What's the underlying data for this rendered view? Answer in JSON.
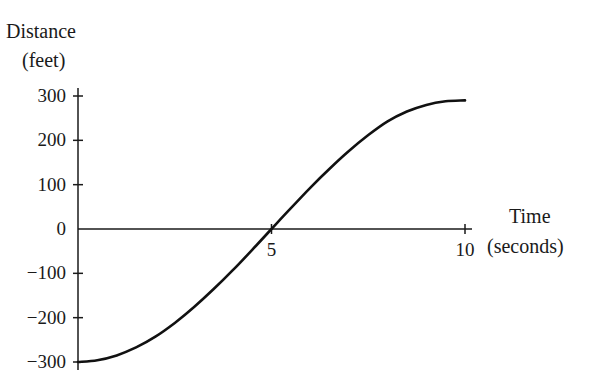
{
  "chart_data": {
    "type": "line",
    "title": "",
    "ylabel_line1": "Distance",
    "ylabel_line2": "(feet)",
    "xlabel_line1": "Time",
    "xlabel_line2": "(seconds)",
    "xlim": [
      0,
      10
    ],
    "ylim": [
      -300,
      300
    ],
    "grid": false,
    "legend": "none",
    "x_ticks": [
      5,
      10
    ],
    "x_tick_labels": [
      "5",
      "10"
    ],
    "y_ticks": [
      300,
      200,
      100,
      0,
      -100,
      -200,
      -300
    ],
    "y_tick_labels": [
      "300",
      "200",
      "100",
      "0",
      "-100",
      "-200",
      "-300"
    ],
    "series": [
      {
        "name": "distance",
        "x": [
          0,
          0.5,
          1,
          1.5,
          2,
          2.5,
          3,
          3.5,
          4,
          4.5,
          5,
          5.5,
          6,
          6.5,
          7,
          7.5,
          8,
          8.5,
          9,
          9.5,
          10
        ],
        "values": [
          -300,
          -296,
          -285,
          -267,
          -243,
          -212,
          -176,
          -136,
          -93,
          -47,
          0,
          47,
          93,
          136,
          176,
          212,
          243,
          265,
          280,
          288,
          290
        ]
      }
    ]
  }
}
